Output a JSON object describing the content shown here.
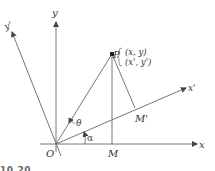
{
  "diagram": {
    "axes": {
      "x": "x",
      "y": "y",
      "x_prime": "x'",
      "y_prime": "y'"
    },
    "points": {
      "origin": "O",
      "P": "P",
      "M": "M",
      "M_prime": "M'"
    },
    "coordinates": {
      "original": "(x, y)",
      "rotated": "(x', y')"
    },
    "angles": {
      "theta": "θ",
      "alpha": "α"
    },
    "caption_fragment": "10.20",
    "colors": {
      "line": "#555555",
      "text": "#333333",
      "background": "#ffffff"
    }
  }
}
